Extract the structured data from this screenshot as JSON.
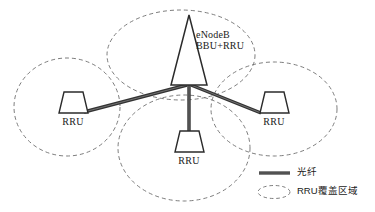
{
  "diagram": {
    "title_node": {
      "line1": "eNodeB",
      "line2": "BBU+RRU"
    },
    "nodes": [
      {
        "id": "enodeb",
        "label": "eNodeB BBU+RRU",
        "shape": "tower-triangle",
        "x": 189,
        "y": 62
      },
      {
        "id": "rru-left",
        "label": "RRU",
        "shape": "trapezoid",
        "x": 72,
        "y": 98
      },
      {
        "id": "rru-right",
        "label": "RRU",
        "shape": "trapezoid",
        "x": 273,
        "y": 98
      },
      {
        "id": "rru-bottom",
        "label": "RRU",
        "shape": "trapezoid",
        "x": 184,
        "y": 138
      }
    ],
    "labels": {
      "rru_left": "RRU",
      "rru_right": "RRU",
      "rru_bottom": "RRU"
    },
    "coverage_areas": [
      {
        "id": "coverage-top",
        "cx": 181,
        "cy": 55,
        "rx": 74,
        "ry": 45
      },
      {
        "id": "coverage-left",
        "cx": 67,
        "cy": 107,
        "rx": 53,
        "ry": 49
      },
      {
        "id": "coverage-right",
        "cx": 274,
        "cy": 109,
        "rx": 63,
        "ry": 47
      },
      {
        "id": "coverage-bottom",
        "cx": 184,
        "cy": 148,
        "rx": 66,
        "ry": 53
      }
    ],
    "links": [
      {
        "id": "fiber-to-left-rru",
        "from": "enodeb",
        "to": "rru-left"
      },
      {
        "id": "fiber-to-right-rru",
        "from": "enodeb",
        "to": "rru-right"
      },
      {
        "id": "fiber-to-bottom-rru",
        "from": "enodeb",
        "to": "rru-bottom"
      }
    ],
    "legend": {
      "items": [
        {
          "id": "legend-fiber",
          "icon": "solid-line-icon",
          "label": "光纤"
        },
        {
          "id": "legend-coverage",
          "icon": "dashed-ellipse-icon",
          "label": "RRU覆盖区域"
        }
      ]
    },
    "colors": {
      "line": "#3a3a3a",
      "fiber": "#333333",
      "dashed": "#6e6e6e",
      "text": "#1a1a1a",
      "background": "#ffffff"
    }
  }
}
